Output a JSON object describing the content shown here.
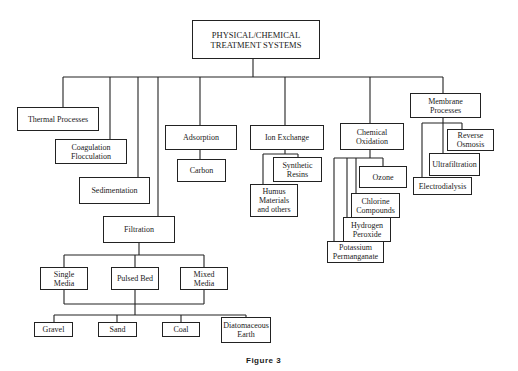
{
  "title": "PHYSICAL/CHEMICAL\nTREATMENT SYSTEMS",
  "caption": "Figure 3",
  "categories": {
    "thermal": "Thermal Processes",
    "coagulation": "Coagulation\nFlocculation",
    "sedimentation": "Sedimentation",
    "filtration": "Filtration",
    "adsorption": "Adsorption",
    "ion_exchange": "Ion Exchange",
    "chemical_oxidation": "Chemical\nOxidation",
    "membrane": "Membrane\nProcesses"
  },
  "adsorption_children": [
    "Carbon"
  ],
  "ion_exchange_children": [
    "Synthetic\nResins",
    "Humus\nMaterials\nand others"
  ],
  "chemical_oxidation_children": [
    "Ozone",
    "Chlorine\nCompounds",
    "Hydrogen\nPeroxide",
    "Potassium\nPermanganate"
  ],
  "membrane_children": [
    "Reverse\nOsmosis",
    "Ultrafiltration",
    "Electrodialysis"
  ],
  "filtration_types": [
    "Single Media",
    "Pulsed Bed",
    "Mixed Media"
  ],
  "filtration_media": [
    "Gravel",
    "Sand",
    "Coal",
    "Diatomaceous\nEarth"
  ]
}
